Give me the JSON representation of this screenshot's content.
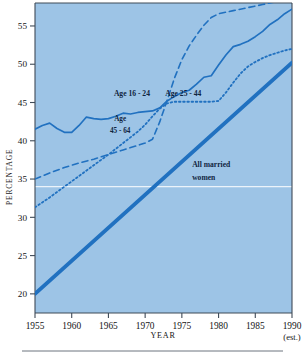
{
  "chart_data": {
    "type": "line",
    "title": "",
    "xlabel": "YEAR",
    "ylabel": "PERCENTAGE",
    "xlim": [
      1955,
      1990
    ],
    "ylim": [
      17.5,
      58
    ],
    "grid": false,
    "legend": "inline-annotations",
    "xticks": [
      "1955",
      "1960",
      "1965",
      "1970",
      "1975",
      "1980",
      "1985",
      "1990"
    ],
    "xtick_values": [
      1955,
      1960,
      1965,
      1970,
      1975,
      1980,
      1985,
      1990
    ],
    "yticks": [
      "20",
      "25",
      "30",
      "35",
      "40",
      "45",
      "50",
      "55"
    ],
    "ytick_values": [
      20,
      25,
      30,
      35,
      40,
      45,
      50,
      55
    ],
    "x_note": "(est.)",
    "reference_line": {
      "y": 34,
      "color": "#ffffff"
    },
    "plot_bg": "#9dc4e6",
    "line_color": "#2171c0",
    "series": [
      {
        "name": "Age 16 - 24",
        "style": "solid",
        "width": 1.7,
        "label_x": 1968.2,
        "label_y": 45.9,
        "x": [
          1955,
          1956,
          1957,
          1958,
          1959,
          1960,
          1961,
          1962,
          1963,
          1964,
          1965,
          1966,
          1967,
          1968,
          1969,
          1970,
          1971,
          1972,
          1973,
          1974,
          1975,
          1976,
          1977,
          1978,
          1979,
          1980,
          1981,
          1982,
          1983,
          1984,
          1985,
          1986,
          1987,
          1988,
          1989,
          1990
        ],
        "y": [
          41.5,
          42.0,
          42.3,
          41.6,
          41.1,
          41.1,
          42.0,
          43.1,
          42.9,
          42.8,
          42.9,
          43.2,
          43.6,
          43.5,
          43.7,
          43.8,
          43.9,
          44.3,
          45.2,
          45.8,
          46.3,
          46.6,
          47.4,
          48.3,
          48.5,
          49.9,
          51.2,
          52.3,
          52.6,
          53.0,
          53.6,
          54.3,
          55.2,
          55.8,
          56.6,
          57.2
        ]
      },
      {
        "name": "Age 25 - 44",
        "style": "dashed",
        "width": 1.6,
        "label_x": 1975.2,
        "label_y": 45.9,
        "x": [
          1955,
          1957,
          1959,
          1961,
          1963,
          1965,
          1967,
          1969,
          1970,
          1971,
          1972,
          1973,
          1974,
          1975,
          1976,
          1977,
          1978,
          1979,
          1980,
          1982,
          1984,
          1986,
          1988,
          1990
        ],
        "y": [
          35.0,
          35.8,
          36.5,
          37.1,
          37.6,
          38.2,
          38.8,
          39.4,
          39.7,
          40.2,
          42.5,
          45.3,
          48.2,
          50.6,
          52.4,
          53.8,
          55.1,
          56.1,
          56.6,
          57.0,
          57.4,
          57.8,
          58.2,
          58.6
        ]
      },
      {
        "name": "Age 45 - 64",
        "style": "dotted",
        "width": 1.8,
        "label_x": 1966.6,
        "label_y": 42.6,
        "label_line2_y": 41.0,
        "x": [
          1955,
          1957,
          1959,
          1961,
          1963,
          1965,
          1967,
          1969,
          1970,
          1971,
          1972,
          1973,
          1974,
          1975,
          1976,
          1977,
          1978,
          1979,
          1980,
          1981,
          1982,
          1983,
          1984,
          1985,
          1986,
          1987,
          1988,
          1989,
          1990
        ],
        "y": [
          31.3,
          32.6,
          34.0,
          35.4,
          36.8,
          38.2,
          39.7,
          41.2,
          42.1,
          43.2,
          44.2,
          44.9,
          45.1,
          45.1,
          45.1,
          45.1,
          45.1,
          45.1,
          45.2,
          46.3,
          47.6,
          48.8,
          49.7,
          50.3,
          50.8,
          51.2,
          51.5,
          51.8,
          52.0
        ]
      },
      {
        "name": "All married women",
        "style": "thick",
        "width": 3.8,
        "label_x": 1976.4,
        "label_y": 36.6,
        "label_line2_y": 34.9,
        "x": [
          1955,
          1990
        ],
        "y": [
          20.0,
          50.2
        ]
      }
    ],
    "annotations": [
      {
        "text": "Age 16 - 24"
      },
      {
        "text": "Age 25 - 44"
      },
      {
        "text": "Age"
      },
      {
        "text": "45 - 64"
      },
      {
        "text": "All married"
      },
      {
        "text": "women"
      }
    ]
  }
}
